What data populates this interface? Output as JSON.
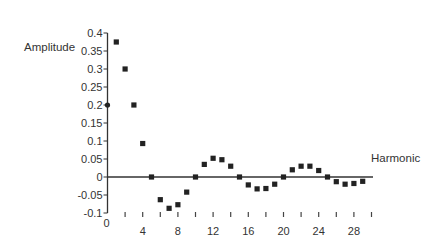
{
  "chart_data": {
    "type": "scatter",
    "title": "",
    "xlabel": "Harmonic",
    "ylabel": "Amplitude",
    "x_tick_labels": [
      "0",
      "4",
      "8",
      "12",
      "16",
      "20",
      "24",
      "28"
    ],
    "y_tick_labels": [
      "0.4",
      "0.35",
      "0.3",
      "0.25",
      "0.2",
      "0.15",
      "0.1",
      "0.05",
      "0",
      "-0.05",
      "-0.1"
    ],
    "xlim": [
      0,
      30
    ],
    "ylim": [
      -0.1,
      0.4
    ],
    "grid": false,
    "legend": null,
    "series": [
      {
        "name": "Amplitude",
        "x": [
          0,
          1,
          2,
          3,
          4,
          5,
          6,
          7,
          8,
          9,
          10,
          11,
          12,
          13,
          14,
          15,
          16,
          17,
          18,
          19,
          20,
          21,
          22,
          23,
          24,
          25,
          26,
          27,
          28,
          29
        ],
        "values": [
          0.2,
          0.375,
          0.3,
          0.2,
          0.093,
          0,
          -0.063,
          -0.087,
          -0.077,
          -0.042,
          0,
          0.035,
          0.052,
          0.048,
          0.03,
          0,
          -0.022,
          -0.033,
          -0.032,
          -0.02,
          0,
          0.02,
          0.03,
          0.03,
          0.018,
          0,
          -0.013,
          -0.02,
          -0.018,
          -0.012
        ]
      }
    ]
  }
}
